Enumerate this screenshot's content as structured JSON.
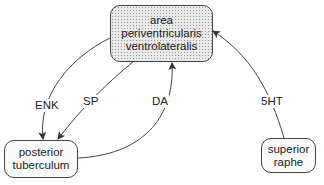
{
  "nodes": {
    "apvl": {
      "lines": [
        "area",
        "periventricularis",
        "ventrolateralis"
      ]
    },
    "pt": {
      "lines": [
        "posterior",
        "tuberculum"
      ]
    },
    "sr": {
      "lines": [
        "superior",
        "raphe"
      ]
    }
  },
  "edges": [
    {
      "label": "ENK",
      "from": "apvl",
      "to": "pt"
    },
    {
      "label": "SP",
      "from": "apvl",
      "to": "pt"
    },
    {
      "label": "DA",
      "from": "pt",
      "to": "apvl"
    },
    {
      "label": "5HT",
      "from": "sr",
      "to": "apvl"
    }
  ]
}
